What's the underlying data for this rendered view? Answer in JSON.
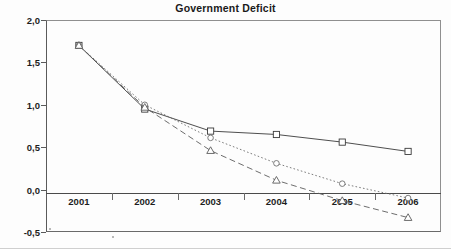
{
  "chart_data": {
    "type": "line",
    "title": "Government Deficit",
    "xlabel": "",
    "ylabel": "",
    "categories": [
      "2001",
      "2002",
      "2003",
      "2004",
      "2005",
      "2006"
    ],
    "ylim": [
      -0.5,
      2.0
    ],
    "ytick_labels": [
      "2,0",
      "1,5",
      "1,0",
      "0,5",
      "0,0",
      "-0,5"
    ],
    "ytick_values": [
      2.0,
      1.5,
      1.0,
      0.5,
      0.0,
      -0.5
    ],
    "grid": false,
    "legend": "none",
    "decimal_separator": ",",
    "series": [
      {
        "name": "series-square-solid",
        "marker": "square",
        "line_style": "solid",
        "color": "#3a3a3a",
        "values": [
          1.7,
          0.95,
          0.69,
          0.65,
          0.56,
          0.45
        ]
      },
      {
        "name": "series-circle-dotted",
        "marker": "circle",
        "line_style": "dotted",
        "color": "#6e6e6e",
        "values": [
          1.7,
          1.0,
          0.61,
          0.31,
          0.07,
          -0.1
        ]
      },
      {
        "name": "series-triangle-dashed",
        "marker": "triangle",
        "line_style": "dashed",
        "color": "#5c5c5c",
        "values": [
          1.7,
          0.97,
          0.46,
          0.11,
          -0.13,
          -0.33
        ]
      }
    ]
  }
}
